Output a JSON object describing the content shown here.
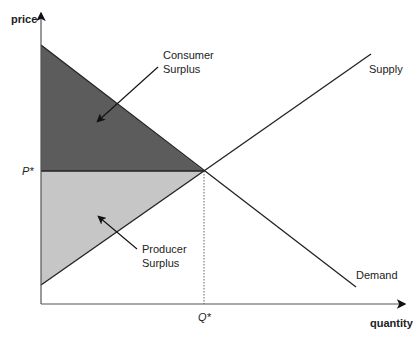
{
  "axes": {
    "y_label": "price",
    "x_label": "quantity",
    "p_star": "P*",
    "q_star": "Q*"
  },
  "curves": {
    "supply": "Supply",
    "demand": "Demand"
  },
  "regions": {
    "consumer_surplus_line1": "Consumer",
    "consumer_surplus_line2": "Surplus",
    "producer_surplus_line1": "Producer",
    "producer_surplus_line2": "Surplus"
  },
  "colors": {
    "consumer_surplus": "#5c5c5c",
    "producer_surplus": "#c6c6c6",
    "lines": "#222222"
  }
}
